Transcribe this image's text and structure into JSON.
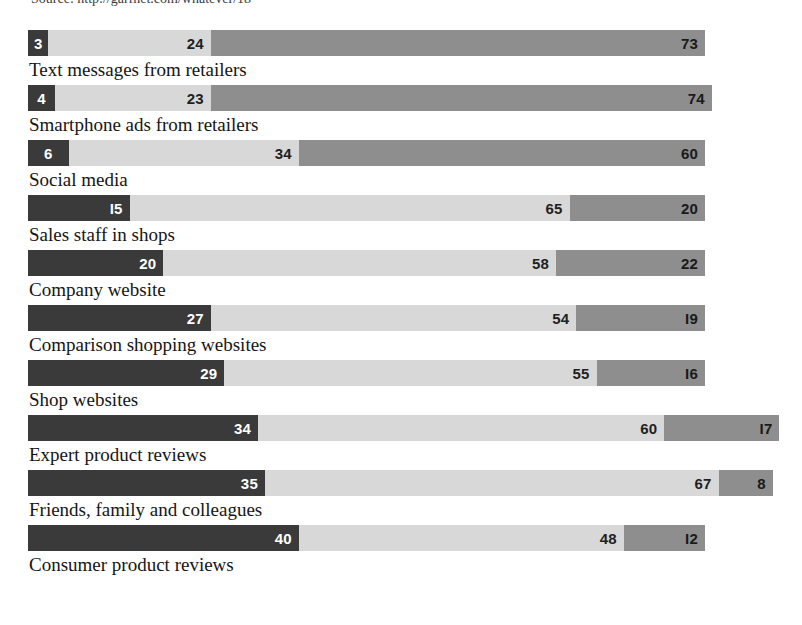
{
  "source": {
    "text": "Source: http://garfnet.com/whatever/18"
  },
  "chart_data": {
    "type": "bar",
    "title": "",
    "subtitle": "",
    "xlabel": "",
    "ylabel": "",
    "orientation": "horizontal",
    "stacked": true,
    "grid": false,
    "legend_position": "none",
    "xlim": [
      0,
      100
    ],
    "unit": "%",
    "categories": [
      "Text messages from retailers",
      "Smartphone ads from retailers",
      "Social media",
      "Sales staff in shops",
      "Company website",
      "Comparison shopping websites",
      "Shop websites",
      "Expert product reviews",
      "Friends, family and colleagues",
      "Consumer product reviews"
    ],
    "series": [
      {
        "name": "segment-1",
        "color": "#3a3a3a",
        "values": [
          3,
          4,
          6,
          15,
          20,
          27,
          29,
          34,
          35,
          40
        ]
      },
      {
        "name": "segment-2",
        "color": "#d8d8d8",
        "values": [
          24,
          23,
          34,
          65,
          58,
          54,
          55,
          60,
          67,
          48
        ]
      },
      {
        "name": "segment-3",
        "color": "#8e8e8e",
        "values": [
          73,
          74,
          60,
          20,
          22,
          19,
          16,
          17,
          8,
          12
        ]
      }
    ],
    "rows": [
      {
        "label": "Text messages from retailers",
        "total": 100,
        "segments": [
          {
            "value": 3,
            "display": "3",
            "tone": "dark"
          },
          {
            "value": 24,
            "display": "24",
            "tone": "light"
          },
          {
            "value": 73,
            "display": "73",
            "tone": "mid"
          }
        ]
      },
      {
        "label": "Smartphone ads from retailers",
        "total": 101,
        "segments": [
          {
            "value": 4,
            "display": "4",
            "tone": "dark"
          },
          {
            "value": 23,
            "display": "23",
            "tone": "light"
          },
          {
            "value": 74,
            "display": "74",
            "tone": "mid"
          }
        ]
      },
      {
        "label": "Social media",
        "total": 100,
        "segments": [
          {
            "value": 6,
            "display": "6",
            "tone": "dark"
          },
          {
            "value": 34,
            "display": "34",
            "tone": "light"
          },
          {
            "value": 60,
            "display": "60",
            "tone": "mid"
          }
        ]
      },
      {
        "label": "Sales staff in shops",
        "total": 100,
        "segments": [
          {
            "value": 15,
            "display": "I5",
            "tone": "dark"
          },
          {
            "value": 65,
            "display": "65",
            "tone": "light"
          },
          {
            "value": 20,
            "display": "20",
            "tone": "mid"
          }
        ]
      },
      {
        "label": "Company website",
        "total": 100,
        "segments": [
          {
            "value": 20,
            "display": "20",
            "tone": "dark"
          },
          {
            "value": 58,
            "display": "58",
            "tone": "light"
          },
          {
            "value": 22,
            "display": "22",
            "tone": "mid"
          }
        ]
      },
      {
        "label": "Comparison shopping websites",
        "total": 100,
        "segments": [
          {
            "value": 27,
            "display": "27",
            "tone": "dark"
          },
          {
            "value": 54,
            "display": "54",
            "tone": "light"
          },
          {
            "value": 19,
            "display": "I9",
            "tone": "mid"
          }
        ]
      },
      {
        "label": "Shop websites",
        "total": 100,
        "segments": [
          {
            "value": 29,
            "display": "29",
            "tone": "dark"
          },
          {
            "value": 55,
            "display": "55",
            "tone": "light"
          },
          {
            "value": 16,
            "display": "I6",
            "tone": "mid"
          }
        ]
      },
      {
        "label": "Expert product reviews",
        "total": 111,
        "segments": [
          {
            "value": 34,
            "display": "34",
            "tone": "dark"
          },
          {
            "value": 60,
            "display": "60",
            "tone": "light"
          },
          {
            "value": 17,
            "display": "I7",
            "tone": "mid"
          }
        ]
      },
      {
        "label": "Friends, family and colleagues",
        "total": 110,
        "segments": [
          {
            "value": 35,
            "display": "35",
            "tone": "dark"
          },
          {
            "value": 67,
            "display": "67",
            "tone": "light"
          },
          {
            "value": 8,
            "display": "8",
            "tone": "mid"
          }
        ]
      },
      {
        "label": "Consumer product reviews",
        "total": 100,
        "segments": [
          {
            "value": 40,
            "display": "40",
            "tone": "dark"
          },
          {
            "value": 48,
            "display": "48",
            "tone": "light"
          },
          {
            "value": 12,
            "display": "I2",
            "tone": "mid"
          }
        ]
      }
    ]
  }
}
